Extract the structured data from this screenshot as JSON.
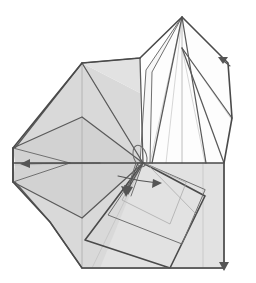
{
  "figure": {
    "kind": "line-art technical illustration",
    "caption": "",
    "canvas": {
      "width": 256,
      "height": 283,
      "background": "#ffffff"
    },
    "palette": {
      "paper_front_gray": "#d9d9d9",
      "paper_front_gray_dark": "#d2d2d2",
      "paper_front_gray_light": "#e2e2e2",
      "paper_back_white": "#fdfdfd",
      "paper_back_offwhite": "#f7f7f7",
      "edge_heavy": "#4a4a4a",
      "edge_main": "#5a5a5a",
      "edge_mid": "#707070",
      "crease_line": "#a8a8a8",
      "crease_fine": "#bcbcbc",
      "arrow_color": "#555555"
    },
    "labels": {
      "body_region": "main folded body",
      "peak_region": "upright white point",
      "left_point": "left narrow point",
      "lower_flaps": "rotated lower flaps",
      "center_node": "central convergence vertex"
    },
    "annotations": {
      "center_vertex": {
        "x": 143,
        "y": 163
      },
      "apex_vertex": {
        "x": 182,
        "y": 17
      },
      "left_tip": {
        "x": 13,
        "y": 165
      },
      "bottom_left_corner": {
        "x": 82,
        "y": 268
      },
      "bottom_right_corner": {
        "x": 224,
        "y": 268
      },
      "right_edge_x": 224,
      "horizon_y": 163
    },
    "geometry": {
      "faces": [
        {
          "name": "body-upper-left-face",
          "tone": "gray",
          "points": "82,63 140,93 140,163 15,163 15,148"
        },
        {
          "name": "body-upper-right-face",
          "tone": "gray-l",
          "points": "82,63 140,58 140,93"
        },
        {
          "name": "body-lower-face",
          "tone": "gray",
          "points": "15,163 140,163 224,163 224,268 82,268 50,222 15,182"
        },
        {
          "name": "left-point-upper",
          "tone": "gray-d",
          "points": "13,148 82,117 143,163 15,163"
        },
        {
          "name": "left-point-lower",
          "tone": "gray-d",
          "points": "13,182 82,218 143,163 15,163"
        },
        {
          "name": "right-lower-face",
          "tone": "gray-l",
          "points": "143,163 224,163 224,268 100,268"
        },
        {
          "name": "peak-white-main",
          "tone": "white",
          "points": "182,17 205,163 150,163 152,72"
        },
        {
          "name": "peak-white-left-flap",
          "tone": "offwhite",
          "points": "182,17 146,70 140,163 150,163 152,72"
        },
        {
          "name": "peak-white-right",
          "tone": "white",
          "points": "182,17 228,63 232,120 224,163 205,163"
        }
      ],
      "outline_edges": [
        {
          "name": "body-outline",
          "weight": "heavy",
          "points": "82,63 140,58 182,17 228,63 232,120 224,163 224,268 82,268 50,222 13,182 13,148 82,63"
        },
        {
          "name": "horizon-edge",
          "weight": "main",
          "points": "13,163 224,163"
        },
        {
          "name": "right-vertical",
          "weight": "main",
          "points": "224,163 224,268"
        }
      ],
      "creases": [
        {
          "name": "crease-vertical-center",
          "points": "82,63 82,268"
        },
        {
          "name": "crease-peak-axis",
          "points": "182,17 182,163"
        },
        {
          "name": "crease-body-diag-1",
          "points": "82,63 143,163"
        },
        {
          "name": "crease-body-diag-2",
          "points": "140,58 143,163"
        },
        {
          "name": "crease-peak-fan-1",
          "points": "182,17 152,163"
        },
        {
          "name": "crease-peak-fan-2",
          "points": "182,17 205,163"
        },
        {
          "name": "crease-peak-fan-3",
          "points": "182,48 224,163"
        },
        {
          "name": "crease-peak-fan-4",
          "points": "182,48 232,120"
        },
        {
          "name": "crease-flap-edge-left",
          "points": "146,70 140,163"
        },
        {
          "name": "crease-flap-edge-right",
          "points": "152,72 150,163"
        }
      ],
      "lower_flaps": [
        {
          "name": "flap-quad-outer",
          "points": "143,163 85,240 170,268 205,196"
        },
        {
          "name": "flap-quad-inner",
          "points": "143,163 108,215 180,244 203,190"
        },
        {
          "name": "flap-quad-thin",
          "points": "143,163 120,200 168,222 185,184"
        }
      ],
      "fold_arrows": [
        {
          "name": "fold-arrow-down",
          "path": "143,163 128,190 124,196",
          "head_at": "124,196",
          "head_dir": 200
        },
        {
          "name": "fold-arrow-right",
          "path": "120,178 152,182 160,183",
          "head_at": "160,183",
          "head_dir": 8
        },
        {
          "name": "fold-arrow-notch",
          "path": "228,63 220,58",
          "head_at": "220,58",
          "head_dir": 210
        },
        {
          "name": "fold-arrow-left",
          "path": "95,163 40,163 20,164",
          "head_at": "20,164",
          "head_dir": 180
        }
      ],
      "rotation_loop": {
        "name": "rotation-loop",
        "cx": 140,
        "cy": 156,
        "rx": 7,
        "ry": 11,
        "rotate": -18
      }
    }
  }
}
